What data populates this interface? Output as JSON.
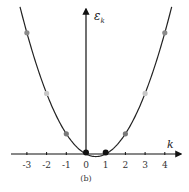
{
  "figure": {
    "caption": "(b)",
    "y_axis_label": "ε",
    "y_axis_subscript": "k",
    "x_axis_label": "k"
  },
  "chart_data": {
    "type": "line",
    "title": "",
    "caption": "(b)",
    "xlabel": "k",
    "ylabel": "ε_k",
    "x_ticks": [
      -3,
      -2,
      -1,
      0,
      1,
      2,
      3,
      4
    ],
    "x_tick_labels": [
      "-3",
      "-2",
      "-1",
      "0",
      "1",
      "2",
      "3",
      "4"
    ],
    "xlim": [
      -3.8,
      4.6
    ],
    "ylim": [
      0,
      14
    ],
    "grid": false,
    "legend": null,
    "curve": {
      "description": "parabola ε_k = k(k-1), minimum at k=0.5",
      "color": "#222222"
    },
    "points": [
      {
        "k": -3,
        "eps": 12,
        "color": "#8a8a8a"
      },
      {
        "k": -2,
        "eps": 6,
        "color": "#c8c8c8"
      },
      {
        "k": -1,
        "eps": 2,
        "color": "#7a7a7a"
      },
      {
        "k": 0,
        "eps": 0,
        "color": "#111111"
      },
      {
        "k": 1,
        "eps": 0,
        "color": "#111111"
      },
      {
        "k": 2,
        "eps": 2,
        "color": "#7a7a7a"
      },
      {
        "k": 3,
        "eps": 6,
        "color": "#c8c8c8"
      },
      {
        "k": 4,
        "eps": 12,
        "color": "#8a8a8a"
      }
    ]
  }
}
